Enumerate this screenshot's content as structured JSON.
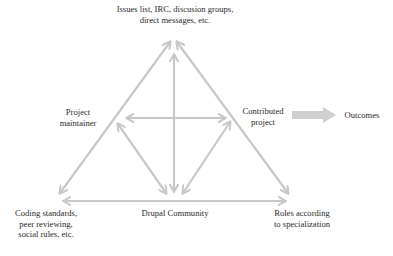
{
  "diagram": {
    "nodes": {
      "top": {
        "lines": [
          "Issues list, IRC, discusion groups,",
          "direct messages, etc."
        ]
      },
      "left": {
        "lines": [
          "Project",
          "maintainer"
        ]
      },
      "right": {
        "lines": [
          "Contributed",
          "project"
        ]
      },
      "bottom_left": {
        "lines": [
          "Coding standards,",
          "peer reviewing,",
          "social rules, etc."
        ]
      },
      "bottom_center": {
        "lines": [
          "Drupal Community"
        ]
      },
      "bottom_right": {
        "lines": [
          "Roles according",
          "to specialization"
        ]
      },
      "outcome": {
        "lines": [
          "Outcomes"
        ]
      }
    },
    "edges": [
      {
        "from": "top",
        "to": "bottom_left",
        "type": "bidirectional"
      },
      {
        "from": "top",
        "to": "bottom_right",
        "type": "bidirectional"
      },
      {
        "from": "bottom_left",
        "to": "bottom_right",
        "type": "bidirectional"
      },
      {
        "from": "top",
        "to": "bottom_center",
        "type": "bidirectional"
      },
      {
        "from": "left",
        "to": "right",
        "type": "bidirectional"
      },
      {
        "from": "left",
        "to": "bottom_center",
        "type": "bidirectional"
      },
      {
        "from": "right",
        "to": "bottom_center",
        "type": "bidirectional"
      },
      {
        "from": "right",
        "to": "outcome",
        "type": "block-arrow"
      }
    ],
    "colors": {
      "arrow": "#c8c8c8",
      "block_arrow": "#d0d0d0",
      "text": "#2a2a2a"
    }
  }
}
